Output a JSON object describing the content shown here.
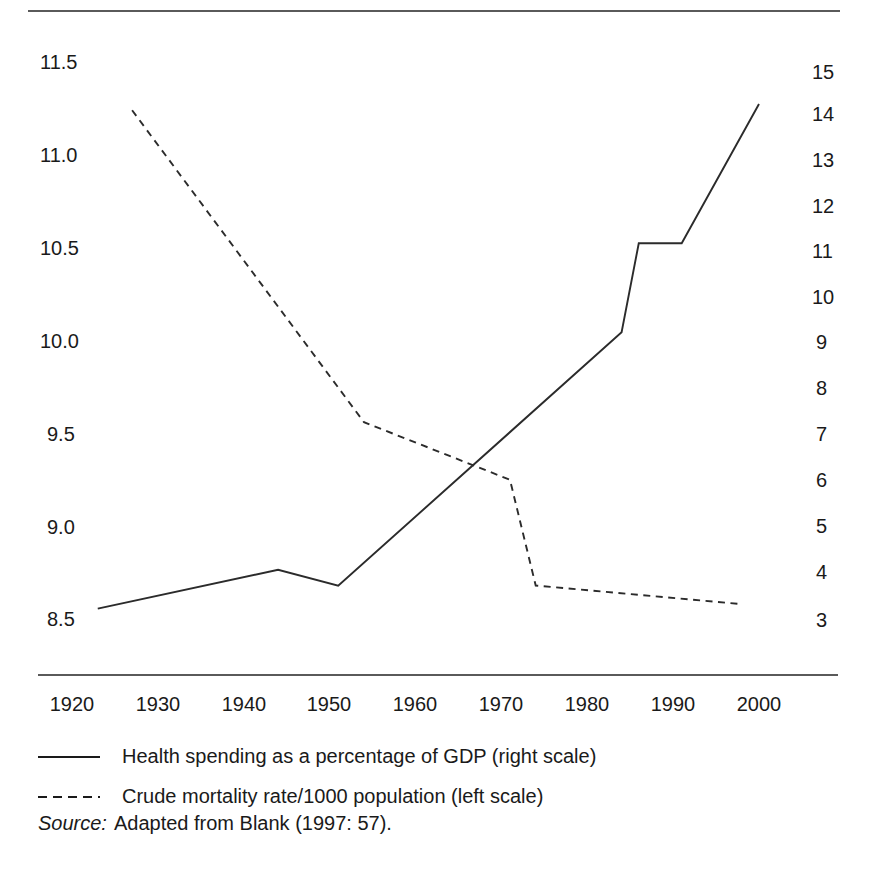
{
  "chart_data": {
    "type": "line",
    "title": "",
    "xlabel": "",
    "ylabel_left": "Crude mortality rate/1000 population",
    "ylabel_right": "Health spending as a percentage of GDP",
    "grid": false,
    "legend_position": "bottom-left",
    "x_ticks": [
      "1920",
      "1930",
      "1940",
      "1950",
      "1960",
      "1970",
      "1980",
      "1990",
      "2000"
    ],
    "x_tick_values": [
      1920,
      1930,
      1940,
      1950,
      1960,
      1970,
      1980,
      1990,
      2000
    ],
    "xlim": [
      1920,
      2000
    ],
    "y_left_ticks": [
      "11.5",
      "11.0",
      "10.5",
      "10.0",
      "9.5",
      "9.0",
      "8.5"
    ],
    "y_left_values": [
      11.5,
      11.0,
      10.5,
      10.0,
      9.5,
      9.0,
      8.5
    ],
    "ylim_left": [
      8.5,
      11.5
    ],
    "y_right_ticks": [
      "15",
      "14",
      "13",
      "12",
      "11",
      "10",
      "9",
      "8",
      "7",
      "6",
      "5",
      "4",
      "3"
    ],
    "y_right_values": [
      15,
      14,
      13,
      12,
      11,
      10,
      9,
      8,
      7,
      6,
      5,
      4,
      3
    ],
    "ylim_right": [
      3,
      15
    ],
    "series": [
      {
        "name": "Health spending as a percentage of GDP (right scale)",
        "axis": "right",
        "style": "solid",
        "color": "#2b2b2b",
        "points": [
          {
            "x": 1923,
            "y": 3.25
          },
          {
            "x": 1944,
            "y": 4.1
          },
          {
            "x": 1951,
            "y": 3.75
          },
          {
            "x": 1984,
            "y": 9.3
          },
          {
            "x": 1986,
            "y": 11.25
          },
          {
            "x": 1991,
            "y": 11.25
          },
          {
            "x": 2000,
            "y": 14.3
          }
        ]
      },
      {
        "name": "Crude mortality rate/1000 population (left scale)",
        "axis": "left",
        "style": "dashed",
        "color": "#2b2b2b",
        "points": [
          {
            "x": 1927,
            "y": 11.24
          },
          {
            "x": 1954,
            "y": 9.56
          },
          {
            "x": 1971,
            "y": 9.25
          },
          {
            "x": 1974,
            "y": 8.68
          },
          {
            "x": 1998,
            "y": 8.58
          }
        ]
      }
    ]
  },
  "legend": {
    "items": [
      {
        "label": "Health spending as a percentage of GDP (right scale)",
        "style": "solid"
      },
      {
        "label": "Crude mortality rate/1000 population (left scale)",
        "style": "dashed"
      }
    ]
  },
  "source": {
    "label": "Source:",
    "text": "Adapted from Blank (1997: 57)."
  }
}
